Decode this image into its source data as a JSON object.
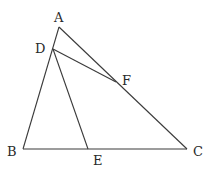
{
  "diagram": {
    "type": "geometry-triangle",
    "points": {
      "A": {
        "x": 59,
        "y": 27,
        "label": "A",
        "lx": 54,
        "ly": 22
      },
      "D": {
        "x": 53,
        "y": 49,
        "label": "D",
        "lx": 35,
        "ly": 53
      },
      "F": {
        "x": 116,
        "y": 82,
        "label": "F",
        "lx": 122,
        "ly": 85
      },
      "B": {
        "x": 23,
        "y": 149,
        "label": "B",
        "lx": 7,
        "ly": 156
      },
      "E": {
        "x": 88,
        "y": 149,
        "label": "E",
        "lx": 93,
        "ly": 165
      },
      "C": {
        "x": 187,
        "y": 149,
        "label": "C",
        "lx": 193,
        "ly": 156
      }
    },
    "segments": [
      [
        "A",
        "B"
      ],
      [
        "A",
        "C"
      ],
      [
        "B",
        "C"
      ],
      [
        "D",
        "E"
      ],
      [
        "D",
        "F"
      ]
    ],
    "colors": {
      "line": "#3a3a3a",
      "label": "#2a2a2a",
      "background": "#ffffff"
    }
  }
}
